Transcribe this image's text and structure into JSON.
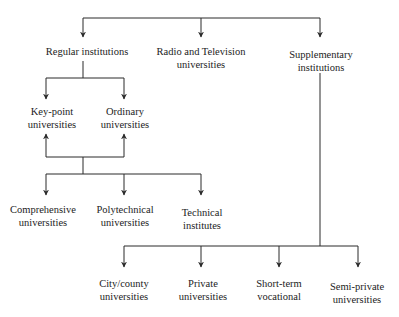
{
  "diagram": {
    "type": "hierarchy",
    "colors": {
      "line": "#2a2a2a",
      "text": "#1c1c1c",
      "background": "#ffffff"
    },
    "level1": {
      "regular": {
        "line1": "Regular institutions"
      },
      "radio_tv": {
        "line1": "Radio and Television",
        "line2": "universities"
      },
      "supplementary": {
        "line1": "Supplementary",
        "line2": "institutions"
      }
    },
    "regular_children": {
      "key_point": {
        "line1": "Key-point",
        "line2": "universities"
      },
      "ordinary": {
        "line1": "Ordinary",
        "line2": "universities"
      }
    },
    "shared_types": {
      "comprehensive": {
        "line1": "Comprehensive",
        "line2": "universities"
      },
      "polytechnical": {
        "line1": "Polytechnical",
        "line2": "universities"
      },
      "technical": {
        "line1": "Technical",
        "line2": "institutes"
      }
    },
    "supplementary_children": {
      "city_county": {
        "line1": "City/county",
        "line2": "universities"
      },
      "private": {
        "line1": "Private",
        "line2": "universities"
      },
      "short_term": {
        "line1": "Short-term",
        "line2": "vocational"
      },
      "semi_private": {
        "line1": "Semi-private",
        "line2": "universities"
      }
    }
  }
}
